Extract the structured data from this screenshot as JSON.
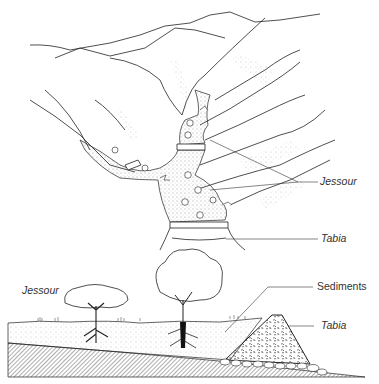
{
  "figure": {
    "top_view": {
      "labels": {
        "jessour": "Jessour",
        "tabia": "Tabia"
      }
    },
    "cross_section": {
      "labels": {
        "jessour": "Jessour",
        "sediments": "Sediments",
        "tabia": "Tabia"
      }
    }
  }
}
